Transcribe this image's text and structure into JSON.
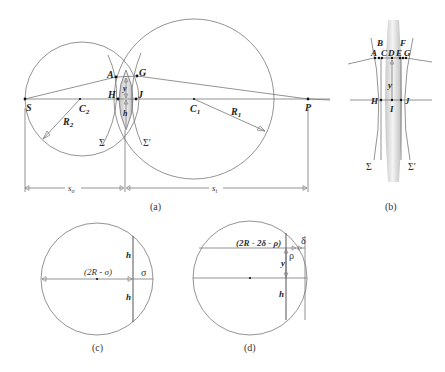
{
  "panel_a": {
    "caption": "(a)",
    "points": {
      "S": "S",
      "C2": "C",
      "C2_sub": "2",
      "C1": "C",
      "C1_sub": "1",
      "R2": "R",
      "R2_sub": "2",
      "R1": "R",
      "R1_sub": "1",
      "A": "A",
      "G": "G",
      "H": "H",
      "J": "J",
      "P": "P",
      "y": "y",
      "h": "h",
      "Sigma": "Σ",
      "Sigma_prime": "Σ′"
    },
    "dimensions": {
      "so": "s",
      "so_sub": "o",
      "si": "s",
      "si_sub": "i"
    }
  },
  "panel_b": {
    "caption": "(b)",
    "points": {
      "A": "A",
      "B": "B",
      "C": "C",
      "D": "D",
      "E": "E",
      "F": "F",
      "G": "G",
      "H": "H",
      "I": "I",
      "J": "J",
      "y": "y",
      "Sigma": "Σ",
      "Sigma_prime": "Σ′"
    }
  },
  "panel_c": {
    "caption": "(c)",
    "labels": {
      "chord_expr": "(2R - σ)",
      "sigma": "σ",
      "h_top": "h",
      "h_bottom": "h"
    }
  },
  "panel_d": {
    "caption": "(d)",
    "labels": {
      "chord_expr": "(2R - 2δ - ρ)",
      "delta": "δ",
      "rho": "ρ",
      "y": "y",
      "h": "h"
    }
  },
  "colors": {
    "line": "#777777",
    "text": "#222222",
    "lens_fill": "#cfcfcf",
    "background": "#ffffff"
  }
}
